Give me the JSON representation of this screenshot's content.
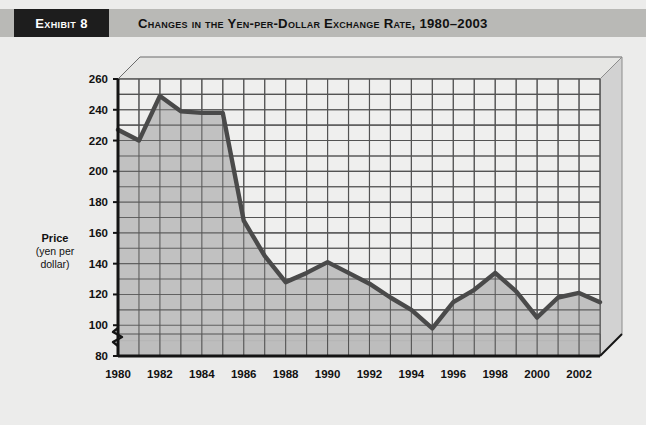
{
  "exhibit": {
    "tag_label": "Exhibit 8",
    "title": "Changes in the Yen-per-Dollar Exchange Rate, 1980–2003"
  },
  "colors": {
    "page_background": "#ececeb",
    "header_band": "#b9b9b6",
    "tag_background": "#1d1d1d",
    "tag_text": "#ffffff",
    "plot_floor": "#dedede",
    "area_fill": "#bdbdbd",
    "line": "#4a4a4a",
    "gridline": "#545454",
    "axis": "#141414",
    "side_wall": "#d2d2d2"
  },
  "axes": {
    "y_title_main": "Price",
    "y_title_sub_line1": "(yen per",
    "y_title_sub_line2": "dollar)",
    "x_title": "Year",
    "y_ticks": [
      80,
      100,
      120,
      140,
      160,
      180,
      200,
      220,
      240,
      260
    ],
    "y_axis_broken": true,
    "x_tick_labels": [
      "1980",
      "1982",
      "1984",
      "1986",
      "1988",
      "1990",
      "1992",
      "1994",
      "1996",
      "1998",
      "2000",
      "2002"
    ]
  },
  "chart_data": {
    "type": "area",
    "title": "Changes in the Yen-per-Dollar Exchange Rate, 1980–2003",
    "xlabel": "Year",
    "ylabel": "Price (yen per dollar)",
    "ylim": [
      80,
      260
    ],
    "xlim": [
      1980,
      2003
    ],
    "grid": true,
    "legend": "none",
    "y_axis_break": true,
    "x": [
      1980,
      1981,
      1982,
      1983,
      1984,
      1985,
      1986,
      1987,
      1988,
      1989,
      1990,
      1991,
      1992,
      1993,
      1994,
      1995,
      1996,
      1997,
      1998,
      1999,
      2000,
      2001,
      2002,
      2003
    ],
    "values": [
      227,
      220,
      249,
      239,
      238,
      238,
      168,
      145,
      128,
      134,
      141,
      134,
      127,
      118,
      110,
      98,
      115,
      123,
      134,
      122,
      105,
      118,
      121,
      115
    ],
    "series": [
      {
        "name": "Yen per dollar",
        "values": [
          227,
          220,
          249,
          239,
          238,
          238,
          168,
          145,
          128,
          134,
          141,
          134,
          127,
          118,
          110,
          98,
          115,
          123,
          134,
          122,
          105,
          118,
          121,
          115
        ]
      }
    ]
  }
}
